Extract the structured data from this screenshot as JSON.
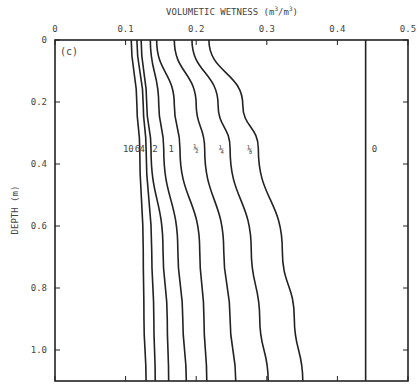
{
  "chart_data": {
    "type": "line",
    "panel_label": "(c)",
    "title": "",
    "xlabel": "VOLUMETIC WETNESS (m3/m3)",
    "xlabel_parts": {
      "base": "VOLUMETIC WETNESS (m",
      "sup1": "3",
      "mid": "/m",
      "sup2": "3",
      "end": ")"
    },
    "ylabel": "DEPTH (m)",
    "xlim": [
      0,
      0.5
    ],
    "ylim": [
      0,
      1.1
    ],
    "x_axis_position": "top",
    "y_inverted": true,
    "grid": false,
    "x_ticks": [
      0,
      0.1,
      0.2,
      0.3,
      0.4,
      0.5
    ],
    "x_tick_labels": [
      "0",
      "0.1",
      "0.2",
      "0.3",
      "0.4",
      "0.5"
    ],
    "y_ticks": [
      0,
      0.2,
      0.4,
      0.6,
      0.8,
      1.0
    ],
    "y_tick_labels": [
      "0",
      "0.2",
      "0.4",
      "0.6",
      "0.8",
      "1.0"
    ],
    "depth": [
      0,
      0.21,
      0.35,
      0.68,
      0.9,
      1.1
    ],
    "series": [
      {
        "name": "10",
        "label": "10",
        "values": [
          0.108,
          0.116,
          0.12,
          0.125,
          0.126,
          0.129
        ]
      },
      {
        "name": "6",
        "label": "6",
        "values": [
          0.116,
          0.125,
          0.129,
          0.137,
          0.14,
          0.142
        ]
      },
      {
        "name": "4",
        "label": "4",
        "values": [
          0.122,
          0.13,
          0.136,
          0.153,
          0.159,
          0.161
        ]
      },
      {
        "name": "2",
        "label": "2",
        "values": [
          0.135,
          0.147,
          0.154,
          0.174,
          0.181,
          0.186
        ]
      },
      {
        "name": "1",
        "label": "1",
        "values": [
          0.144,
          0.169,
          0.177,
          0.205,
          0.211,
          0.215
        ]
      },
      {
        "name": "1/2",
        "label": "½",
        "values": [
          0.169,
          0.2,
          0.212,
          0.239,
          0.248,
          0.256
        ]
      },
      {
        "name": "1/4",
        "label": "¼",
        "values": [
          0.194,
          0.231,
          0.248,
          0.278,
          0.29,
          0.302
        ]
      },
      {
        "name": "1/8",
        "label": "⅛",
        "values": [
          0.218,
          0.266,
          0.288,
          0.322,
          0.339,
          0.351
        ]
      },
      {
        "name": "0",
        "label": "0",
        "values": [
          0.44,
          0.44,
          0.44,
          0.44,
          0.44,
          0.44
        ]
      }
    ],
    "curve_label_depth": 0.35,
    "line_color": "#222222"
  }
}
